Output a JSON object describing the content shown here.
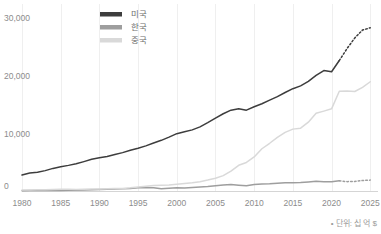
{
  "chart_data": {
    "type": "line",
    "title": "",
    "subtitle": "",
    "xlabel": "",
    "ylabel": "",
    "xlim": [
      1980,
      2026
    ],
    "ylim": [
      0,
      32000
    ],
    "grid": "vertical",
    "legend_position": "top-center",
    "x_ticks": [
      "1980",
      "1985",
      "1990",
      "1995",
      "2000",
      "2005",
      "2010",
      "2015",
      "2020",
      "2025"
    ],
    "x_tick_values": [
      1980,
      1985,
      1990,
      1995,
      2000,
      2005,
      2010,
      2015,
      2020,
      2025
    ],
    "y_ticks": [
      "0",
      "10,000",
      "20,000",
      "30,000"
    ],
    "y_tick_values": [
      0,
      10000,
      20000,
      30000
    ],
    "footnote": "• 단위: 십 억 $",
    "series": [
      {
        "name": "미국",
        "color": "#3d3d3d",
        "projection_from": 2021,
        "x": [
          1980,
          1981,
          1982,
          1983,
          1984,
          1985,
          1986,
          1987,
          1988,
          1989,
          1990,
          1991,
          1992,
          1993,
          1994,
          1995,
          1996,
          1997,
          1998,
          1999,
          2000,
          2001,
          2002,
          2003,
          2004,
          2005,
          2006,
          2007,
          2008,
          2009,
          2010,
          2011,
          2012,
          2013,
          2014,
          2015,
          2016,
          2017,
          2018,
          2019,
          2020,
          2021,
          2022,
          2023,
          2024,
          2025
        ],
        "y": [
          2860,
          3210,
          3345,
          3640,
          4040,
          4340,
          4580,
          4860,
          5250,
          5660,
          5960,
          6160,
          6520,
          6860,
          7290,
          7640,
          8070,
          8580,
          9060,
          9630,
          10250,
          10580,
          10930,
          11460,
          12210,
          13040,
          13810,
          14450,
          14710,
          14450,
          15050,
          15600,
          16250,
          16880,
          17610,
          18290,
          18800,
          19610,
          20660,
          21540,
          21320,
          23320,
          25460,
          27360,
          28780,
          29170
        ]
      },
      {
        "name": "한국",
        "color": "#9e9e9e",
        "projection_from": 2021,
        "x": [
          1980,
          1981,
          1982,
          1983,
          1984,
          1985,
          1986,
          1987,
          1988,
          1989,
          1990,
          1991,
          1992,
          1993,
          1994,
          1995,
          1996,
          1997,
          1998,
          1999,
          2000,
          2001,
          2002,
          2003,
          2004,
          2005,
          2006,
          2007,
          2008,
          2009,
          2010,
          2011,
          2012,
          2013,
          2014,
          2015,
          2016,
          2017,
          2018,
          2019,
          2020,
          2021,
          2022,
          2023,
          2024,
          2025
        ],
        "y": [
          65,
          73,
          78,
          89,
          97,
          103,
          119,
          148,
          200,
          243,
          283,
          331,
          356,
          392,
          463,
          566,
          610,
          570,
          383,
          497,
          576,
          548,
          627,
          703,
          784,
          934,
          1053,
          1172,
          1047,
          944,
          1144,
          1253,
          1278,
          1371,
          1484,
          1466,
          1500,
          1624,
          1725,
          1651,
          1644,
          1818,
          1674,
          1713,
          1870,
          1950
        ]
      },
      {
        "name": "중국",
        "color": "#d9d9d9",
        "projection_from": 2025,
        "x": [
          1980,
          1981,
          1982,
          1983,
          1984,
          1985,
          1986,
          1987,
          1988,
          1989,
          1990,
          1991,
          1992,
          1993,
          1994,
          1995,
          1996,
          1997,
          1998,
          1999,
          2000,
          2001,
          2002,
          2003,
          2004,
          2005,
          2006,
          2007,
          2008,
          2009,
          2010,
          2011,
          2012,
          2013,
          2014,
          2015,
          2016,
          2017,
          2018,
          2019,
          2020,
          2021,
          2022,
          2023,
          2024,
          2025
        ],
        "y": [
          191,
          196,
          205,
          230,
          260,
          310,
          300,
          273,
          312,
          348,
          361,
          383,
          427,
          444,
          564,
          734,
          863,
          962,
          1030,
          1094,
          1211,
          1339,
          1471,
          1660,
          1955,
          2286,
          2752,
          3550,
          4594,
          5102,
          6087,
          7552,
          8532,
          9570,
          10476,
          11062,
          11233,
          12310,
          13890,
          14280,
          14690,
          17820,
          17880,
          17790,
          18530,
          19530
        ]
      }
    ]
  },
  "legend": {
    "items": [
      {
        "label": "미국",
        "color": "#3d3d3d"
      },
      {
        "label": "한국",
        "color": "#9e9e9e"
      },
      {
        "label": "중국",
        "color": "#d9d9d9"
      }
    ]
  },
  "axes": {
    "y_labels": [
      "30,000",
      "20,000",
      "10,000",
      "0"
    ],
    "x_labels": [
      "1980",
      "1985",
      "1990",
      "1995",
      "2000",
      "2005",
      "2010",
      "2015",
      "2020",
      "2025"
    ]
  },
  "footnote": {
    "text": "• 단위: 십 억 $"
  }
}
